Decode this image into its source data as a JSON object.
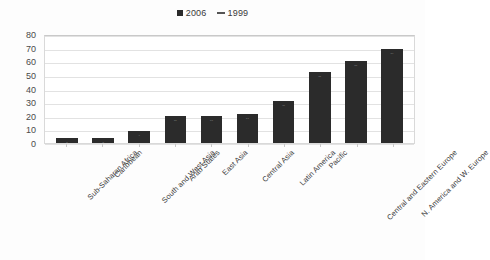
{
  "legend": {
    "position": "top-center",
    "entries": [
      {
        "label": "2006",
        "marker": "square-marker",
        "color": "#2b2b2b"
      },
      {
        "label": "1999",
        "marker": "dash-marker",
        "color": "#555555"
      }
    ]
  },
  "colors": {
    "bar": "#2b2b2b",
    "gridline": "#e2e2e2",
    "plot_border": "#d9d9d9",
    "text": "#3c3c3c"
  },
  "chart_data": {
    "type": "bar",
    "title": "",
    "xlabel": "",
    "ylabel": "",
    "ylim": [
      0,
      80
    ],
    "yticks": [
      80,
      70,
      60,
      50,
      40,
      30,
      20,
      10,
      0
    ],
    "grid": true,
    "legend_position": "top-center",
    "categories": [
      "Sub-Saharan Africa",
      "Caribbean",
      "South and West Asia",
      "Arab States",
      "East Asia",
      "Central Asia",
      "Latin America",
      "Pacific",
      "Central and Eastern Europe",
      "N. America and W. Europe"
    ],
    "series": [
      {
        "name": "2006",
        "values": [
          4,
          4,
          9,
          20,
          20,
          21,
          31,
          52,
          60,
          69
        ]
      },
      {
        "name": "1999",
        "values": [
          4,
          4,
          9,
          20,
          20,
          21,
          31,
          52,
          60,
          69
        ]
      }
    ],
    "values": [
      4,
      4,
      9,
      20,
      20,
      21,
      31,
      52,
      60,
      69
    ]
  }
}
